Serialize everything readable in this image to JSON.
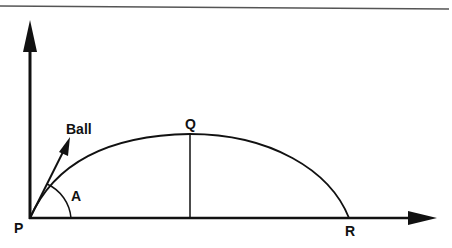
{
  "diagram": {
    "type": "projectile-motion",
    "labels": {
      "origin": "P",
      "peak": "Q",
      "landing": "R",
      "angle": "A",
      "ball": "Ball"
    },
    "colors": {
      "stroke": "#111111",
      "background": "#ffffff",
      "rule": "#555555"
    }
  }
}
